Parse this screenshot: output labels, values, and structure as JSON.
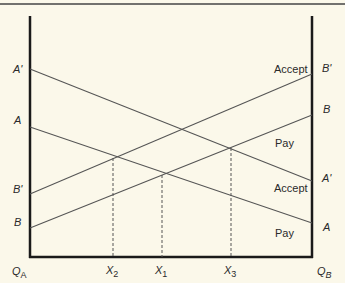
{
  "diagram": {
    "left_axis_label": "Q",
    "left_axis_sub": "A",
    "right_axis_label": "Q",
    "right_axis_sub": "B",
    "left_labels": {
      "a_prime": "A'",
      "a": "A",
      "b_prime": "B'",
      "b": "B"
    },
    "right_labels": {
      "b_prime": "B'",
      "b": "B",
      "a_prime": "A'",
      "a": "A"
    },
    "region_labels": {
      "accept_top": "Accept",
      "pay_top": "Pay",
      "accept_bottom": "Accept",
      "pay_bottom": "Pay"
    },
    "x_ticks": [
      {
        "main": "X",
        "sub": "2"
      },
      {
        "main": "X",
        "sub": "1"
      },
      {
        "main": "X",
        "sub": "3"
      }
    ],
    "colors": {
      "background": "#fbf8ea",
      "axis": "#1a1a1a",
      "line": "#555555"
    }
  }
}
